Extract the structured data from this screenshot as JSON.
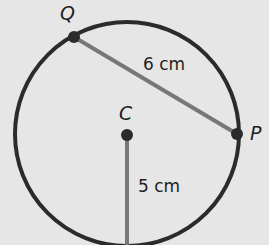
{
  "diagram": {
    "type": "circle-geometry",
    "circle": {
      "cx": 127,
      "cy": 134,
      "r": 112,
      "stroke": "#2b2b2b"
    },
    "points": {
      "Q": {
        "label": "Q",
        "x": 74,
        "y": 37
      },
      "P": {
        "label": "P",
        "x": 237,
        "y": 134
      },
      "C": {
        "label": "C",
        "x": 127,
        "y": 135
      }
    },
    "segments": {
      "chord_QP": {
        "label": "6 cm",
        "color": "#777777"
      },
      "radius_C": {
        "label": "5 cm",
        "color": "#777777"
      }
    },
    "colors": {
      "background": "#e6e6e6",
      "circle": "#2b2b2b",
      "segment": "#777777",
      "dot": "#2b2b2b"
    }
  }
}
